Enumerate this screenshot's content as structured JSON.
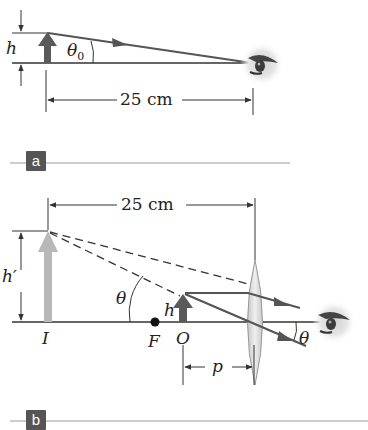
{
  "panel_a": {
    "tag": "a",
    "labels": {
      "height": "h",
      "angle": "θ",
      "angle_sub": "0",
      "distance": "25 cm"
    }
  },
  "panel_b": {
    "tag": "b",
    "labels": {
      "distance": "25 cm",
      "image_height": "h′",
      "object_height": "h",
      "angle": "θ",
      "angle_eye": "θ",
      "image": "I",
      "focal_point": "F",
      "object": "O",
      "object_distance": "p"
    }
  },
  "colors": {
    "line": "#555555",
    "arrow_dark": "#5a5a5a",
    "arrow_light": "#b8b8b8",
    "tag_bg": "#555555",
    "lens": "#d8d8d8"
  }
}
